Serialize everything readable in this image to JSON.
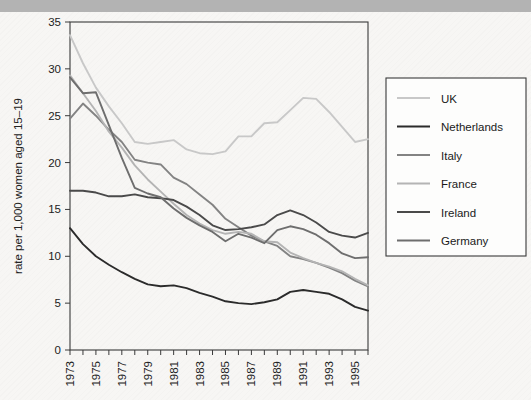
{
  "figure": {
    "background_color": "#f7f6f4",
    "top_band_color": "#b3b3b3",
    "plot_border_color": "#3a3a3a"
  },
  "axes": {
    "y_title": "rate per 1,000 women aged 15–19",
    "y_ticks": [
      "0",
      "5",
      "10",
      "15",
      "20",
      "25",
      "30",
      "35"
    ],
    "x_ticks_labeled": [
      "1973",
      "1975",
      "1977",
      "1979",
      "1981",
      "1983",
      "1985",
      "1987",
      "1989",
      "1991",
      "1993",
      "1995"
    ]
  },
  "legend": {
    "items": [
      {
        "label": "UK",
        "color": "#c8c8c8"
      },
      {
        "label": "Netherlands",
        "color": "#2b2b2b"
      },
      {
        "label": "Italy",
        "color": "#838383"
      },
      {
        "label": "France",
        "color": "#b4b4b4"
      },
      {
        "label": "Ireland",
        "color": "#4a4a4a"
      },
      {
        "label": "Germany",
        "color": "#6e6e6e"
      }
    ]
  },
  "chart_data": {
    "type": "line",
    "title": "",
    "xlabel": "",
    "ylabel": "rate per 1,000 women aged 15–19",
    "xlim": [
      1973,
      1996
    ],
    "ylim": [
      0,
      35
    ],
    "grid": false,
    "legend_position": "right",
    "x": [
      1973,
      1974,
      1975,
      1976,
      1977,
      1978,
      1979,
      1980,
      1981,
      1982,
      1983,
      1984,
      1985,
      1986,
      1987,
      1988,
      1989,
      1990,
      1991,
      1992,
      1993,
      1994,
      1995,
      1996
    ],
    "series": [
      {
        "name": "UK",
        "color": "#c8c8c8",
        "values": [
          33.6,
          30.6,
          28.0,
          26.0,
          24.2,
          22.2,
          22.0,
          22.2,
          22.4,
          21.4,
          21.0,
          20.9,
          21.2,
          22.8,
          22.8,
          24.2,
          24.3,
          25.6,
          26.9,
          26.8,
          25.4,
          23.8,
          22.2,
          22.5
        ]
      },
      {
        "name": "Netherlands",
        "color": "#2b2b2b",
        "values": [
          13.0,
          11.3,
          10.0,
          9.1,
          8.3,
          7.6,
          7.0,
          6.8,
          6.9,
          6.6,
          6.1,
          5.7,
          5.2,
          5.0,
          4.9,
          5.1,
          5.4,
          6.2,
          6.4,
          6.2,
          6.0,
          5.4,
          4.6,
          4.2
        ]
      },
      {
        "name": "Italy",
        "color": "#838383",
        "values": [
          24.7,
          26.3,
          25.0,
          23.5,
          22.2,
          20.3,
          20.0,
          19.8,
          18.4,
          17.7,
          16.6,
          15.5,
          14.0,
          13.1,
          12.2,
          11.6,
          11.1,
          10.0,
          9.7,
          9.3,
          8.8,
          8.2,
          7.4,
          6.8
        ]
      },
      {
        "name": "France",
        "color": "#b4b4b4",
        "values": [
          29.3,
          27.4,
          25.5,
          23.3,
          21.6,
          19.7,
          18.2,
          16.9,
          15.6,
          14.4,
          13.5,
          12.8,
          12.4,
          12.6,
          12.4,
          11.6,
          11.5,
          10.4,
          9.8,
          9.3,
          8.9,
          8.4,
          7.6,
          6.9
        ]
      },
      {
        "name": "Ireland",
        "color": "#4a4a4a",
        "values": [
          17.0,
          17.0,
          16.8,
          16.4,
          16.4,
          16.6,
          16.3,
          16.2,
          16.0,
          15.3,
          14.4,
          13.3,
          12.8,
          12.9,
          13.1,
          13.4,
          14.4,
          14.9,
          14.4,
          13.6,
          12.6,
          12.2,
          12.0,
          12.5
        ]
      },
      {
        "name": "Germany",
        "color": "#6e6e6e",
        "values": [
          29.1,
          27.4,
          27.5,
          24.0,
          20.5,
          17.3,
          16.7,
          16.3,
          15.1,
          14.1,
          13.3,
          12.6,
          11.6,
          12.4,
          12.0,
          11.4,
          12.8,
          13.2,
          12.9,
          12.3,
          11.4,
          10.3,
          9.8,
          9.9
        ]
      }
    ]
  }
}
